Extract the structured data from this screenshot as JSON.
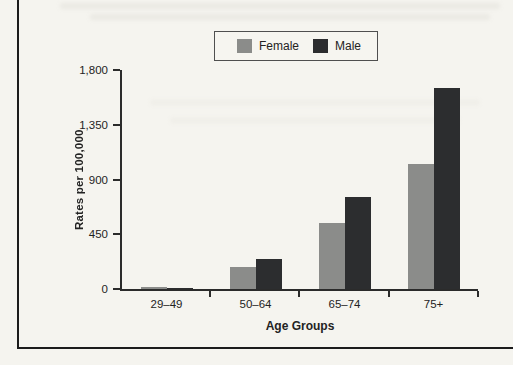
{
  "figure": {
    "background_color": "#f5f4ef",
    "border_color": "#1b1b1b",
    "axis_color": "#2b2b2b"
  },
  "legend": {
    "items": [
      {
        "label": "Female",
        "color": "#8b8c8a"
      },
      {
        "label": "Male",
        "color": "#2c2d2f"
      }
    ]
  },
  "chart_data": {
    "type": "bar",
    "categories": [
      "29–49",
      "50–64",
      "65–74",
      "75+"
    ],
    "series": [
      {
        "name": "Female",
        "color": "#8b8c8a",
        "values": [
          15,
          180,
          540,
          1030
        ]
      },
      {
        "name": "Male",
        "color": "#2c2d2f",
        "values": [
          8,
          250,
          760,
          1650
        ]
      }
    ],
    "title": "",
    "xlabel": "Age Groups",
    "ylabel": "Rates per 100,000",
    "ylim": [
      0,
      1800
    ],
    "yticks": [
      0,
      450,
      900,
      1350,
      1800
    ],
    "ytick_labels": [
      "0",
      "450",
      "900",
      "1,350",
      "1,800"
    ],
    "grid": false,
    "legend_position": "top"
  }
}
